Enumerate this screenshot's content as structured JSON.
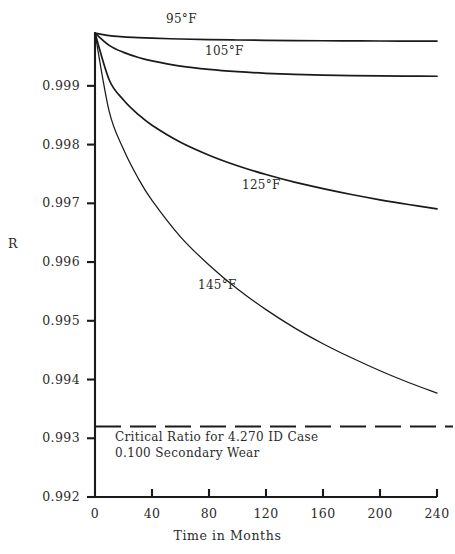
{
  "chart_data": {
    "type": "line",
    "title": "",
    "xlabel": "Time in Months",
    "ylabel": "R",
    "xlim": [
      0,
      240
    ],
    "ylim": [
      0.992,
      0.9999
    ],
    "grid": false,
    "legend_position": "inline-curve-labels",
    "xticks": [
      0,
      40,
      80,
      120,
      160,
      200,
      240
    ],
    "xtick_labels": [
      "0",
      "40",
      "80",
      "120",
      "160",
      "200",
      "240"
    ],
    "yticks": [
      0.992,
      0.993,
      0.994,
      0.995,
      0.996,
      0.997,
      0.998,
      0.999
    ],
    "ytick_labels": [
      "0.992",
      "0.993",
      "0.994",
      "0.995",
      "0.996",
      "0.997",
      "0.998",
      "0.999"
    ],
    "x": [
      0,
      10,
      20,
      30,
      40,
      60,
      80,
      100,
      120,
      140,
      160,
      180,
      200,
      220,
      240
    ],
    "series": [
      {
        "name": "95°F",
        "label": "95°F",
        "values": [
          0.9999,
          0.999855,
          0.999835,
          0.999822,
          0.999812,
          0.999798,
          0.999788,
          0.999781,
          0.999775,
          0.999771,
          0.999768,
          0.999766,
          0.999764,
          0.999763,
          0.999762
        ]
      },
      {
        "name": "105°F",
        "label": "105°F",
        "values": [
          0.9999,
          0.99969,
          0.99957,
          0.999487,
          0.999425,
          0.999337,
          0.99928,
          0.999241,
          0.999214,
          0.999196,
          0.999183,
          0.999175,
          0.999169,
          0.999166,
          0.999164
        ]
      },
      {
        "name": "125°F",
        "label": "125°F",
        "values": [
          0.9999,
          0.9991,
          0.99876,
          0.99852,
          0.99833,
          0.99804,
          0.99782,
          0.99764,
          0.99749,
          0.99736,
          0.99725,
          0.99715,
          0.99706,
          0.99698,
          0.996905
        ]
      },
      {
        "name": "145°F",
        "label": "145°F",
        "values": [
          0.9999,
          0.99856,
          0.99792,
          0.99744,
          0.99705,
          0.99643,
          0.99595,
          0.99554,
          0.99519,
          0.99488,
          0.99461,
          0.99437,
          0.99415,
          0.99395,
          0.99377
        ]
      }
    ],
    "reference_line": {
      "name": "critical-ratio",
      "value": 0.9932,
      "style": "dashed",
      "label_line1": "Critical Ratio for 4.270 ID Case",
      "label_line2": "0.100 Secondary Wear"
    }
  },
  "axes": {
    "y_title": "R",
    "x_title": "Time in Months"
  },
  "colors": {
    "background": "#ffffff",
    "ink": "#1a1a1a",
    "text": "#2b2b2b"
  }
}
